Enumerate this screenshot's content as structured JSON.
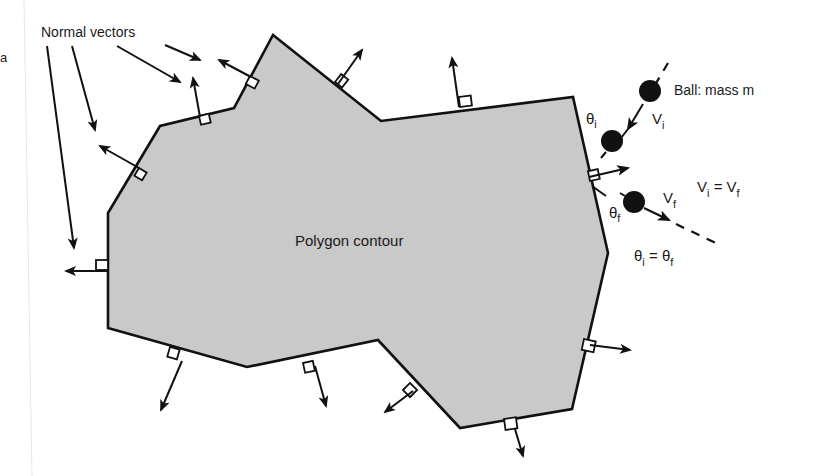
{
  "labels": {
    "normal_vectors": "Normal vectors",
    "polygon_contour": "Polygon contour",
    "ball": "Ball: mass m",
    "v_i": "V",
    "v_i_sub": "i",
    "v_f": "V",
    "v_f_sub": "f",
    "theta_i": "θ",
    "theta_i_sub": "i",
    "theta_f": "θ",
    "theta_f_sub": "f",
    "velocity_eq_lhs": "V",
    "velocity_eq_lhs_sub": "i",
    "velocity_eq_mid": " = V",
    "velocity_eq_rhs_sub": "f",
    "angle_eq_lhs": "θ",
    "angle_eq_lhs_sub": "i",
    "angle_eq_mid": " = θ",
    "angle_eq_rhs_sub": "f",
    "margin_glyph": "a"
  },
  "colors": {
    "polygon_fill": "#c9c9c9",
    "stroke": "#111111",
    "background": "#ffffff"
  },
  "polygon": {
    "vertices": [
      [
        108,
        213
      ],
      [
        160,
        126
      ],
      [
        234,
        108
      ],
      [
        273,
        35
      ],
      [
        381,
        121
      ],
      [
        573,
        97
      ],
      [
        608,
        253
      ],
      [
        572,
        409
      ],
      [
        460,
        428
      ],
      [
        378,
        340
      ],
      [
        247,
        367
      ],
      [
        108,
        328
      ]
    ]
  }
}
